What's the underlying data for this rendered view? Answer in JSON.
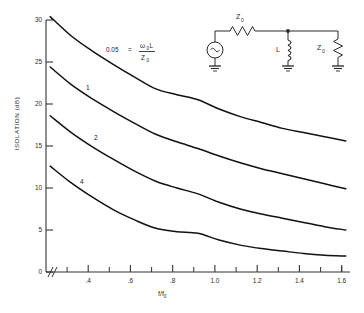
{
  "chart_data": {
    "type": "line",
    "title": "",
    "xlabel": "f/f0",
    "xlabel_main": "f/f",
    "xlabel_sub": "0",
    "ylabel": "ISOLATION (dB)",
    "xlim": [
      0.28,
      1.72
    ],
    "ylim": [
      0,
      30
    ],
    "grid": false,
    "legend": "inline curve labels",
    "xticks": [
      0.4,
      0.6,
      0.8,
      1.0,
      1.2,
      1.4,
      1.6
    ],
    "xtick_labels": [
      ".4",
      ".6",
      ".8",
      "1.0",
      "1.2",
      "1.4",
      "1.6"
    ],
    "xminor_step": 0.1,
    "yticks": [
      0,
      5,
      10,
      15,
      20,
      25,
      30
    ],
    "ytick_labels": [
      "0",
      "5",
      "10",
      "15",
      "20",
      "25",
      "30"
    ],
    "axis_break_y": "0",
    "annotation": {
      "text": "0.05 = w0L/Z0",
      "value": "0.05",
      "equals": "=",
      "numerator_main": "L",
      "numerator_omega": "ω",
      "numerator_omega_sub": "0",
      "denominator_main": "Z",
      "denominator_sub": "0"
    },
    "series": [
      {
        "name": "0.05",
        "label": "0.05",
        "x": [
          0.3,
          0.4,
          0.5,
          0.6,
          0.7,
          0.8,
          0.9,
          1.0,
          1.1,
          1.2,
          1.3,
          1.4,
          1.5,
          1.6,
          1.7
        ],
        "values": [
          30.4,
          28.1,
          26.3,
          24.7,
          23.2,
          21.8,
          21.1,
          20.5,
          19.4,
          18.5,
          17.8,
          17.1,
          16.6,
          16.1,
          15.6
        ]
      },
      {
        "name": "1",
        "label": "1",
        "x": [
          0.3,
          0.4,
          0.5,
          0.6,
          0.7,
          0.8,
          0.9,
          1.0,
          1.1,
          1.2,
          1.3,
          1.4,
          1.5,
          1.6,
          1.7
        ],
        "values": [
          24.4,
          22.3,
          20.6,
          19.1,
          17.7,
          16.4,
          15.5,
          14.7,
          13.8,
          13.0,
          12.3,
          11.7,
          11.1,
          10.5,
          9.9
        ]
      },
      {
        "name": "2",
        "label": "2",
        "x": [
          0.3,
          0.4,
          0.5,
          0.6,
          0.7,
          0.8,
          0.9,
          1.0,
          1.1,
          1.2,
          1.3,
          1.4,
          1.5,
          1.6,
          1.7
        ],
        "values": [
          18.6,
          16.6,
          14.9,
          13.4,
          12.0,
          10.8,
          10.0,
          9.3,
          8.3,
          7.5,
          6.9,
          6.4,
          5.9,
          5.4,
          5.0
        ]
      },
      {
        "name": "4",
        "label": "4",
        "x": [
          0.3,
          0.4,
          0.5,
          0.6,
          0.7,
          0.8,
          0.9,
          1.0,
          1.1,
          1.2,
          1.3,
          1.4,
          1.5,
          1.6,
          1.7
        ],
        "values": [
          12.6,
          10.6,
          8.9,
          7.4,
          6.2,
          5.2,
          4.8,
          4.6,
          3.8,
          3.2,
          2.8,
          2.5,
          2.2,
          2.0,
          1.9
        ]
      }
    ]
  },
  "circuit": {
    "source_symbol": "~",
    "series_impedance_main": "Z",
    "series_impedance_sub": "0",
    "inductor_label": "L",
    "load_impedance_main": "Z",
    "load_impedance_sub": "0"
  },
  "colors": {
    "curve": "#111111",
    "axis": "#333333",
    "text": "#2a2a2a",
    "background": "#ffffff"
  }
}
